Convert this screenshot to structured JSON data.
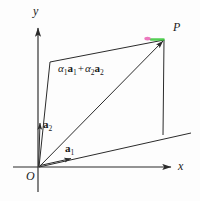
{
  "figure": {
    "type": "vector-parallelogram-diagram",
    "background_color": "#fdfdfd",
    "stroke_color": "#2b2b2b",
    "labels": {
      "y_axis": "y",
      "x_axis": "x",
      "origin": "O",
      "point_p": "P",
      "vector_a1_name": "a",
      "vector_a1_sub": "1",
      "vector_a2_name": "a",
      "vector_a2_sub": "2",
      "combination_alpha1": "α",
      "combination_alpha1_sub": "1",
      "combination_a1": "a",
      "combination_a1_sub": "1",
      "combination_plus": "+",
      "combination_alpha2": "α",
      "combination_alpha2_sub": "2",
      "combination_a2": "a",
      "combination_a2_sub": "2"
    },
    "highlight": {
      "green_color": "#37c837",
      "magenta_color": "#e85ab0"
    },
    "geometry": {
      "origin": [
        39,
        167
      ],
      "point_p": [
        164,
        40
      ],
      "a1_tip": [
        72,
        158
      ],
      "a2_tip": [
        40,
        122
      ],
      "a1_extension_end": [
        191,
        133
      ],
      "a2_extension_end": [
        50,
        62
      ],
      "x_axis_tip": [
        173,
        167
      ],
      "y_axis_tip": [
        38,
        26
      ]
    }
  }
}
